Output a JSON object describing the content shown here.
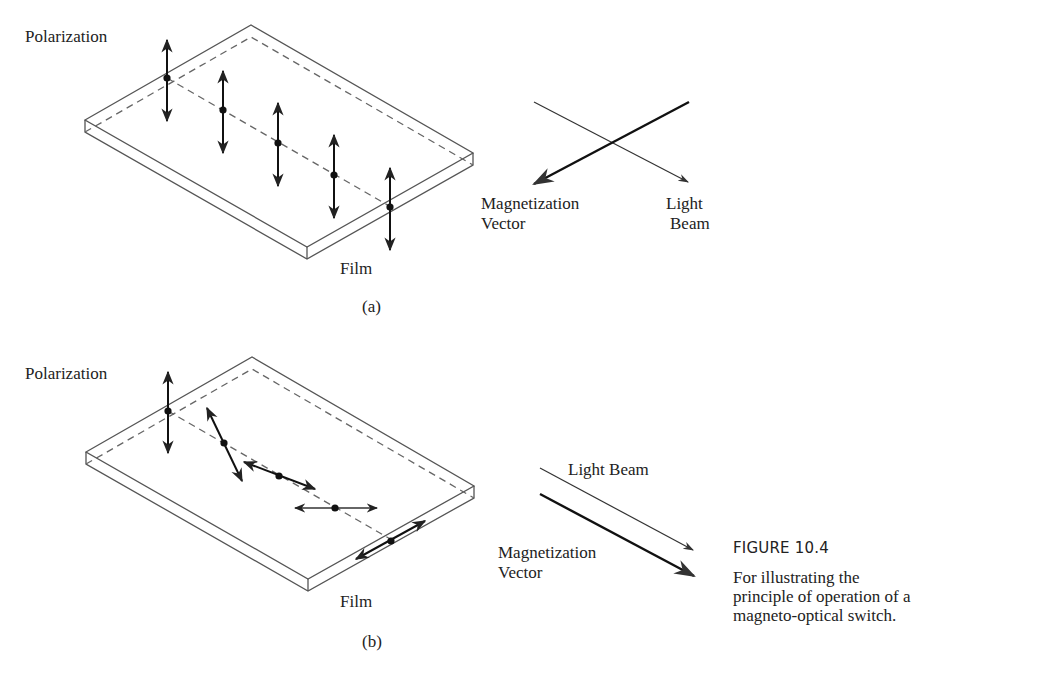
{
  "figure": {
    "title": "FIGURE 10.4",
    "caption": "For illustrating the principle of operation of a magneto-optical switch."
  },
  "panel_a": {
    "polarization_label": "Polarization",
    "film_label": "Film",
    "panel_label": "(a)",
    "magnetization_label_line1": "Magnetization",
    "magnetization_label_line2": "Vector",
    "light_label_line1": "Light",
    "light_label_line2": "Beam",
    "relation": "Magnetization vector perpendicular to light beam; polarization unchanged (all vertical)"
  },
  "panel_b": {
    "polarization_label": "Polarization",
    "film_label": "Film",
    "panel_label": "(b)",
    "light_label": "Light Beam",
    "magnetization_label_line1": "Magnetization",
    "magnetization_label_line2": "Vector",
    "relation": "Magnetization vector parallel to light beam; polarization rotates progressively through film"
  }
}
